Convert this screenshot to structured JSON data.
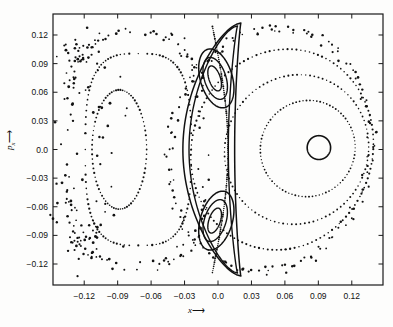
{
  "figure": {
    "background_color": "#fdfdfc",
    "ink_color": "#111111",
    "frame_color": "#1a1a1a"
  },
  "axes": {
    "x_label_text": "x",
    "x_label_arrow": "⟶",
    "y_label_text": "p",
    "y_label_subscript": "x",
    "y_label_arrow": "⟶",
    "x_ticks": [
      "-0.12",
      "-0.09",
      "-0.06",
      "-0.03",
      "0.0",
      "0.03",
      "0.06",
      "0.09",
      "0.12"
    ],
    "y_ticks": [
      "0.12",
      "0.09",
      "0.06",
      "0.03",
      "0.0",
      "-0.03",
      "-0.06",
      "-0.09",
      "-0.12"
    ]
  },
  "chart_data": {
    "type": "scatter",
    "title": "",
    "xlabel": "x",
    "ylabel": "p_x",
    "xlim": [
      -0.148,
      0.148
    ],
    "ylim": [
      -0.142,
      0.142
    ],
    "x_ticks": [
      -0.12,
      -0.09,
      -0.06,
      -0.03,
      0.0,
      0.03,
      0.06,
      0.09,
      0.12
    ],
    "y_ticks": [
      -0.12,
      -0.09,
      -0.06,
      -0.03,
      0.0,
      0.03,
      0.06,
      0.09,
      0.12
    ],
    "grid": false,
    "legend": "none",
    "series": [
      {
        "name": "right-fixed-point-orbit",
        "style": "solid",
        "linewidth": 1.6,
        "shape": "ellipse",
        "center": [
          0.0905,
          0.002
        ],
        "rx": 0.0105,
        "ry": 0.0125,
        "rotation": 0
      },
      {
        "name": "right-inner-torus",
        "style": "dotted",
        "dot_size": 1.5,
        "n_points": 86,
        "shape": "ellipse",
        "center": [
          0.0805,
          0.001
        ],
        "rx": 0.0425,
        "ry": 0.0505,
        "rotation": -4
      },
      {
        "name": "right-middle-torus",
        "style": "dotted",
        "dot_size": 1.6,
        "n_points": 104,
        "shape": "ellipse",
        "center": [
          0.0705,
          0.0
        ],
        "rx": 0.0645,
        "ry": 0.0785,
        "rotation": -6
      },
      {
        "name": "right-outer-torus",
        "style": "dotted",
        "dot_size": 1.8,
        "n_points": 128,
        "shape": "ellipse",
        "center": [
          0.0575,
          0.0
        ],
        "rx": 0.0815,
        "ry": 0.1055,
        "rotation": -7
      },
      {
        "name": "right-outermost-chaotic-band",
        "style": "dotted-scatter",
        "dot_size": 2.0,
        "n_points": 150,
        "shape": "ellipse",
        "center": [
          0.047,
          0.0
        ],
        "rx": 0.0905,
        "ry": 0.1275,
        "rotation": -6,
        "jitter": 0.0045
      },
      {
        "name": "separatrix-outer",
        "style": "solid",
        "linewidth": 1.5,
        "shape": "separatrix",
        "xpoint_top": [
          0.0205,
          0.1325
        ],
        "xpoint_bottom": [
          0.0205,
          -0.1325
        ],
        "lobe_width": 0.027,
        "lobe_center_x": -0.0045
      },
      {
        "name": "separatrix-inner",
        "style": "solid",
        "linewidth": 1.4,
        "shape": "separatrix",
        "xpoint_top": [
          0.0175,
          0.1295
        ],
        "xpoint_bottom": [
          0.0175,
          -0.1295
        ],
        "lobe_width": 0.0205,
        "lobe_center_x": -0.0055
      },
      {
        "name": "island-upper-outer",
        "style": "solid",
        "linewidth": 1.5,
        "shape": "ellipse",
        "center": [
          -0.0015,
          0.0745
        ],
        "rx": 0.0145,
        "ry": 0.0315,
        "rotation": 13
      },
      {
        "name": "island-upper-middle",
        "style": "solid",
        "linewidth": 1.4,
        "shape": "ellipse",
        "center": [
          -0.0025,
          0.0745
        ],
        "rx": 0.0098,
        "ry": 0.0225,
        "rotation": 14
      },
      {
        "name": "island-upper-inner",
        "style": "solid",
        "linewidth": 1.4,
        "shape": "ellipse",
        "center": [
          -0.003,
          0.0745
        ],
        "rx": 0.0052,
        "ry": 0.0135,
        "rotation": 15
      },
      {
        "name": "island-lower-outer",
        "style": "solid",
        "linewidth": 1.5,
        "shape": "ellipse",
        "center": [
          -0.0015,
          -0.0745
        ],
        "rx": 0.0145,
        "ry": 0.0315,
        "rotation": -13
      },
      {
        "name": "island-lower-middle",
        "style": "solid",
        "linewidth": 1.4,
        "shape": "ellipse",
        "center": [
          -0.0025,
          -0.0745
        ],
        "rx": 0.0098,
        "ry": 0.0225,
        "rotation": -14
      },
      {
        "name": "island-lower-inner",
        "style": "solid",
        "linewidth": 1.4,
        "shape": "ellipse",
        "center": [
          -0.003,
          -0.0745
        ],
        "rx": 0.0052,
        "ry": 0.0135,
        "rotation": -15
      },
      {
        "name": "central-dotted-divider",
        "style": "dotted",
        "dot_size": 1.6,
        "n_points": 120,
        "shape": "arc-vertical",
        "x_center": 0.009,
        "bulge": 0.014,
        "y_extent": 0.129
      },
      {
        "name": "left-inner-torus",
        "style": "dotted",
        "dot_size": 1.7,
        "n_points": 78,
        "shape": "ellipse",
        "center": [
          -0.0885,
          0.0
        ],
        "rx": 0.0245,
        "ry": 0.0625,
        "rotation": 0
      },
      {
        "name": "left-middle-torus",
        "style": "dotted",
        "dot_size": 1.8,
        "n_points": 104,
        "shape": "rounded-rect",
        "center": [
          -0.0715,
          0.0
        ],
        "rx": 0.0475,
        "ry": 0.1005,
        "corner": 0.55
      },
      {
        "name": "left-outer-chaotic-band",
        "style": "dotted-scatter",
        "dot_size": 2.1,
        "n_points": 132,
        "shape": "rounded-rect",
        "center": [
          -0.0745,
          0.0
        ],
        "rx": 0.0605,
        "ry": 0.1215,
        "corner": 0.5,
        "jitter": 0.006
      },
      {
        "name": "left-chaotic-scatter",
        "style": "scatter",
        "dot_size": 2.2,
        "n_points": 96,
        "shape": "band",
        "x_range": [
          -0.142,
          -0.098
        ],
        "y_range": [
          -0.108,
          0.108
        ],
        "jitter": 0.012
      }
    ]
  }
}
